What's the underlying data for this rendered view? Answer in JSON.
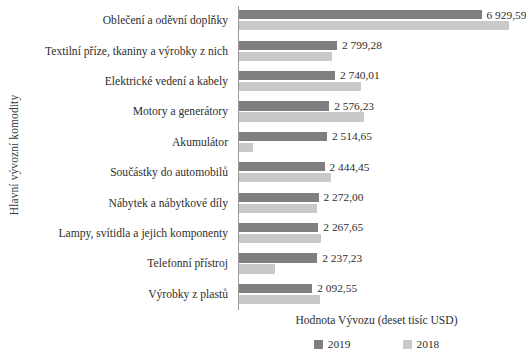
{
  "chart_data": {
    "type": "bar",
    "orientation": "horizontal",
    "title": "",
    "xlabel": "Hodnota Vývozu (deset tisíc USD)",
    "ylabel": "Hlavní vývozní komodity",
    "grid": false,
    "legend_position": "bottom",
    "xlim": [
      0,
      7800
    ],
    "categories": [
      "Oblečení a oděvní doplňky",
      "Textilní příze, tkaniny a výrobky z nich",
      "Elektrické vedení a kabely",
      "Motory a generátory",
      "Akumulátor",
      "Součástky do automobilů",
      "Nábytek a nábytkové díly",
      "Lampy, svítidla a jejich komponenty",
      "Telefonní přístroj",
      "Výrobky z plastů"
    ],
    "series": [
      {
        "name": "2019",
        "color": "#7f7f7f",
        "values": [
          6929.59,
          2799.28,
          2740.01,
          2576.23,
          2514.65,
          2444.45,
          2272.0,
          2267.65,
          2237.23,
          2092.55
        ],
        "value_labels": [
          "6 929,59",
          "2 799,28",
          "2 740,01",
          "2 576,23",
          "2 514,65",
          "2 444,45",
          "2 272,00",
          "2 267,65",
          "2 237,23",
          "2 092,55"
        ]
      },
      {
        "name": "2018",
        "color": "#c9c9c9",
        "values": [
          7720,
          2660,
          3480,
          3560,
          410,
          2620,
          2230,
          2330,
          1030,
          2300
        ],
        "value_labels": [
          "",
          "",
          "",
          "",
          "",
          "",
          "",
          "",
          "",
          ""
        ]
      }
    ],
    "legend": [
      "2019",
      "2018"
    ]
  }
}
